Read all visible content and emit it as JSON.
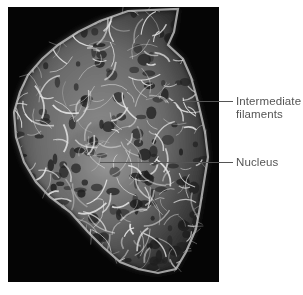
{
  "figure": {
    "kind": "fluorescence micrograph of a cell",
    "labels": [
      {
        "id": "intermediate-filaments",
        "lines": [
          "Intermediate",
          "filaments"
        ]
      },
      {
        "id": "nucleus",
        "lines": [
          "Nucleus"
        ]
      }
    ]
  },
  "colors": {
    "background": "#050505",
    "filament": "#e8e8e8",
    "label_text": "#555555",
    "leader_line": "#555555"
  }
}
